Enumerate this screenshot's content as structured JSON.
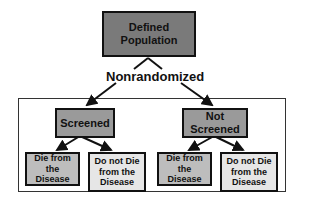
{
  "diagram": {
    "root": {
      "label": "Defined Population",
      "color": "#7a7a7a"
    },
    "split_label": "Nonrandomized",
    "groups": [
      {
        "label": "Screened",
        "color": "#9a9a9a",
        "outcomes": [
          {
            "label": "Die from the Disease",
            "color": "#bdbdbd"
          },
          {
            "label": "Do not Die from the Disease",
            "color": "#e6e6e6"
          }
        ]
      },
      {
        "label": "Not Screened",
        "color": "#9a9a9a",
        "outcomes": [
          {
            "label": "Die from the Disease",
            "color": "#bdbdbd"
          },
          {
            "label": "Do not Die from the Disease",
            "color": "#e6e6e6"
          }
        ]
      }
    ]
  }
}
